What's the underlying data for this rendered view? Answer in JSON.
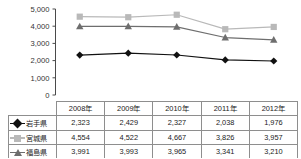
{
  "chart_data": {
    "type": "line",
    "title": "",
    "xlabel": "",
    "ylabel": "",
    "ylim": [
      0,
      5000
    ],
    "ytick_step": 1000,
    "yticks": [
      "0",
      "1,000",
      "2,000",
      "3,000",
      "4,000",
      "5,000"
    ],
    "grid": false,
    "legend_position": "table-first-column",
    "categories": [
      "2008年",
      "2009年",
      "2010年",
      "2011年",
      "2012年"
    ],
    "series": [
      {
        "name": "岩手県",
        "marker": "diamond",
        "color": "#111111",
        "values": [
          2323,
          2429,
          2327,
          2038,
          1976
        ],
        "labels": [
          "2,323",
          "2,429",
          "2,327",
          "2,038",
          "1,976"
        ]
      },
      {
        "name": "宮城県",
        "marker": "square",
        "color": "#b9b9b9",
        "values": [
          4554,
          4522,
          4667,
          3826,
          3957
        ],
        "labels": [
          "4,554",
          "4,522",
          "4,667",
          "3,826",
          "3,957"
        ]
      },
      {
        "name": "福島県",
        "marker": "triangle",
        "color": "#6e6e6e",
        "values": [
          3991,
          3993,
          3965,
          3341,
          3210
        ],
        "labels": [
          "3,991",
          "3,993",
          "3,965",
          "3,341",
          "3,210"
        ]
      }
    ]
  },
  "table": {
    "corner_label": "",
    "headers": [
      "2008年",
      "2009年",
      "2010年",
      "2011年",
      "2012年"
    ],
    "rows": [
      {
        "label": "岩手県",
        "marker": "diamond-marker",
        "cells": [
          "2,323",
          "2,429",
          "2,327",
          "2,038",
          "1,976"
        ]
      },
      {
        "label": "宮城県",
        "marker": "square-marker",
        "cells": [
          "4,554",
          "4,522",
          "4,667",
          "3,826",
          "3,957"
        ]
      },
      {
        "label": "福島県",
        "marker": "triangle-marker",
        "cells": [
          "3,991",
          "3,993",
          "3,965",
          "3,341",
          "3,210"
        ]
      }
    ]
  },
  "axis": {
    "y_ticks": [
      "5,000",
      "4,000",
      "3,000",
      "2,000",
      "1,000",
      "0"
    ]
  },
  "colors": {
    "iwate": "#111111",
    "miyagi": "#b9b9b9",
    "fukushima": "#6e6e6e",
    "axis": "#4a4a4a",
    "border": "#8e8e8e"
  }
}
